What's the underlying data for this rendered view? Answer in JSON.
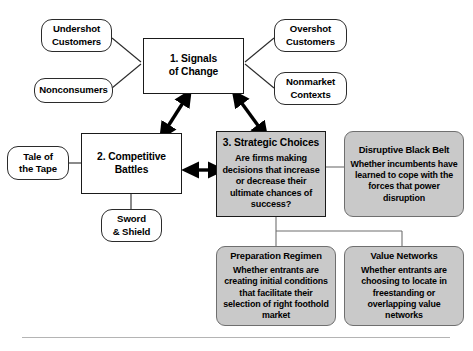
{
  "diagram": {
    "colors": {
      "shaded_fill": "#c9c9c9",
      "outline": "#1a1a1a",
      "arrow": "#000000",
      "divider": "#b4b4b4"
    },
    "main_boxes": [
      {
        "id": "signals-of-change",
        "title": "1. Signals",
        "title2": "of Change",
        "shaded": false
      },
      {
        "id": "competitive-battles",
        "title": "2. Competitive",
        "title2": "Battles",
        "shaded": false
      },
      {
        "id": "strategic-choices",
        "title": "3. Strategic Choices",
        "body": "Are firms making decisions that increase or decrease their ultimate chances of success?",
        "shaded": true
      }
    ],
    "satellites": [
      {
        "id": "undershot-customers",
        "line1": "Undershot",
        "line2": "Customers"
      },
      {
        "id": "nonconsumers",
        "line1": "Nonconsumers",
        "line2": ""
      },
      {
        "id": "overshot-customers",
        "line1": "Overshot",
        "line2": "Customers"
      },
      {
        "id": "nonmarket-contexts",
        "line1": "Nonmarket",
        "line2": "Contexts"
      },
      {
        "id": "tale-of-the-tape",
        "line1": "Tale of",
        "line2": "the Tape"
      },
      {
        "id": "sword-and-shield",
        "line1": "Sword",
        "line2": "& Shield"
      }
    ],
    "gray_cards": [
      {
        "id": "disruptive-black-belt",
        "title": "Disruptive Black Belt",
        "body": "Whether incumbents have learned to cope with the forces that power disruption"
      },
      {
        "id": "preparation-regimen",
        "title": "Preparation Regimen",
        "body": "Whether entrants are creating initial conditions that facilitate their selection of right foothold market"
      },
      {
        "id": "value-networks",
        "title": "Value Networks",
        "body": "Whether entrants are choosing to locate in freestanding or overlapping value networks"
      }
    ]
  }
}
